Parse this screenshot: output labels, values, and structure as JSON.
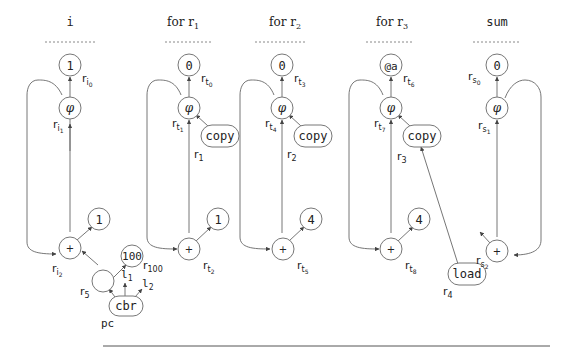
{
  "columns": [
    {
      "id": "i",
      "title": "i",
      "title_font": "mono"
    },
    {
      "id": "for-r1",
      "title": "for r",
      "title_sub": "1"
    },
    {
      "id": "for-r2",
      "title": "for r",
      "title_sub": "2"
    },
    {
      "id": "for-r3",
      "title": "for r",
      "title_sub": "3"
    },
    {
      "id": "sum",
      "title": "sum",
      "title_font": "mono"
    }
  ],
  "nodes": {
    "i_init": "1",
    "i_phi": "φ",
    "i_add": "+",
    "i_inc": "1",
    "i_limit": "100",
    "i_cmp": "",
    "i_cbr": "cbr",
    "t1_init": "0",
    "t1_phi": "φ",
    "t1_copy": "copy",
    "t1_add": "+",
    "t1_inc": "1",
    "t2_init": "0",
    "t2_phi": "φ",
    "t2_copy": "copy",
    "t2_add": "+",
    "t2_inc": "4",
    "t3_init": "@a",
    "t3_phi": "φ",
    "t3_copy": "copy",
    "t3_add": "+",
    "t3_inc": "4",
    "t3_load": "load",
    "s_init": "0",
    "s_phi": "φ",
    "s_add": "+"
  },
  "labels": {
    "ri0": {
      "base": "r",
      "sub": "i",
      "subsub": "0"
    },
    "ri1": {
      "base": "r",
      "sub": "i",
      "subsub": "1"
    },
    "ri2": {
      "base": "r",
      "sub": "i",
      "subsub": "2"
    },
    "r5": {
      "base": "r",
      "sub": "5"
    },
    "l1": {
      "base": "l",
      "sub": "1"
    },
    "l2": {
      "base": "l",
      "sub": "2"
    },
    "pc": {
      "base": "pc"
    },
    "rt0": {
      "base": "r",
      "sub": "t",
      "subsub": "0"
    },
    "rt1": {
      "base": "r",
      "sub": "t",
      "subsub": "1"
    },
    "r1": {
      "base": "r",
      "sub": "1"
    },
    "r100": {
      "base": "r",
      "sub": "100"
    },
    "rt2": {
      "base": "r",
      "sub": "t",
      "subsub": "2"
    },
    "rt3": {
      "base": "r",
      "sub": "t",
      "subsub": "3"
    },
    "rt4": {
      "base": "r",
      "sub": "t",
      "subsub": "4"
    },
    "r2": {
      "base": "r",
      "sub": "2"
    },
    "rt5": {
      "base": "r",
      "sub": "t",
      "subsub": "5"
    },
    "rt6": {
      "base": "r",
      "sub": "t",
      "subsub": "6"
    },
    "rt7": {
      "base": "r",
      "sub": "t",
      "subsub": "7"
    },
    "r3": {
      "base": "r",
      "sub": "3"
    },
    "rt8": {
      "base": "r",
      "sub": "t",
      "subsub": "8"
    },
    "r4": {
      "base": "r",
      "sub": "4"
    },
    "rs0": {
      "base": "r",
      "sub": "s",
      "subsub": "0"
    },
    "rs1": {
      "base": "r",
      "sub": "s",
      "subsub": "1"
    },
    "rs2": {
      "base": "r",
      "sub": "s",
      "subsub": "2"
    }
  },
  "colors": {
    "stroke": "#777777",
    "text": "#222222",
    "background": "#ffffff"
  }
}
